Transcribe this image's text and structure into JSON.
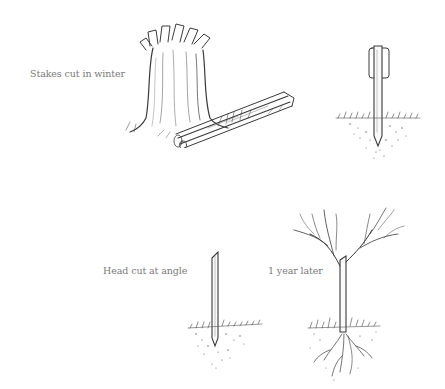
{
  "captions": {
    "stakes_cut": "Stakes cut in winter",
    "head_cut": "Head cut at angle",
    "one_year": "1 year later"
  },
  "illustrations": [
    {
      "name": "pollarded-stump-with-stakes",
      "caption": "Stakes cut in winter"
    },
    {
      "name": "stake-in-ground-with-clip",
      "caption": ""
    },
    {
      "name": "stake-head-cut-at-angle",
      "caption": "Head cut at angle"
    },
    {
      "name": "rooted-tree-one-year-later",
      "caption": "1 year later"
    }
  ],
  "colors": {
    "ink": "#3a3a3a",
    "caption": "#7a7a7a",
    "background": "#ffffff"
  }
}
